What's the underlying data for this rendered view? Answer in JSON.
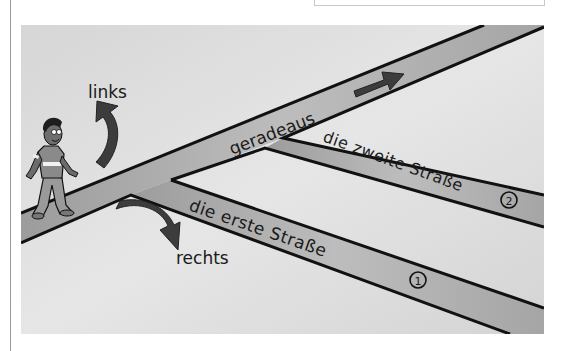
{
  "illustration": {
    "labels": {
      "left": "links",
      "right": "rechts",
      "straight": "geradeaus",
      "first_street": "die erste Straße",
      "second_street": "die zweite Straße",
      "first_number": "1",
      "second_number": "2"
    },
    "colors": {
      "background": "#dcdcdc",
      "road": "#b4b4b4",
      "road_edge": "#111111",
      "arrow": "#3c3c3c"
    },
    "icons": [
      "walking-person-icon",
      "turn-left-arrow-icon",
      "turn-right-arrow-icon",
      "straight-arrow-icon"
    ]
  }
}
